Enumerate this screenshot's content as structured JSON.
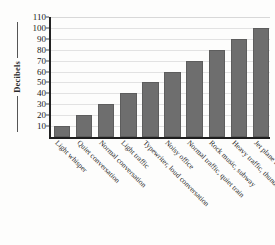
{
  "chart_data": {
    "type": "bar",
    "title": "",
    "xlabel": "",
    "ylabel": "Decibels",
    "ylim": [
      0,
      110
    ],
    "yticks": [
      10,
      20,
      30,
      40,
      50,
      60,
      70,
      80,
      90,
      100,
      110
    ],
    "grid": true,
    "legend": null,
    "categories": [
      "Light whisper",
      "Quiet conversation",
      "Normal conversation",
      "Light traffic",
      "Typewriter, loud conversation",
      "Noisy office",
      "Normal traffic, quiet train",
      "Rock music, subway",
      "Heavy traffic, thunder",
      "Jet plane at takeoff"
    ],
    "values": [
      10,
      20,
      30,
      40,
      50,
      60,
      70,
      80,
      90,
      100
    ],
    "bar_color": "#6e6e6e",
    "gridline_color": "#e2e2e2",
    "axis_color": "#1d1d1d",
    "background_color": "#fdfdfc"
  }
}
